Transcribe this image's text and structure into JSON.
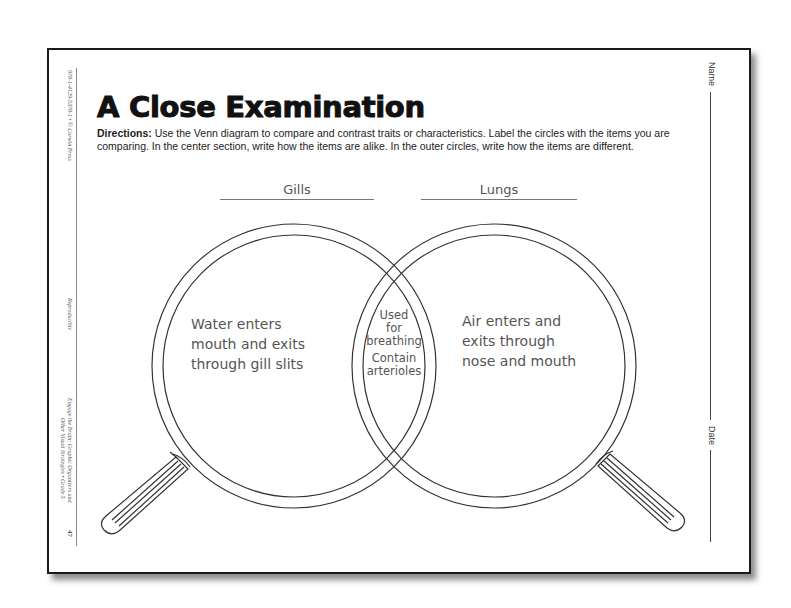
{
  "worksheet": {
    "title": "A Close Examination",
    "directions_label": "Directions:",
    "directions_text": " Use the Venn diagram to compare and contrast traits or characteristics. Label the circles with the items you are comparing. In the center section, write how the items are alike. In the outer circles, write how the items are different.",
    "left_margin": {
      "isbn": "978-1-4129-5378-1 • © Corwin Press",
      "reproducible": "Reproducible",
      "book_line1": "Engage the Brain: Graphic Organizers and",
      "book_line2": "Other Visual Strategies • Grade 5",
      "page_number": "47"
    },
    "right_margin": {
      "name_label": "Name",
      "date_label": "Date"
    }
  },
  "venn": {
    "left_label": "Gills",
    "right_label": "Lungs",
    "left_only": [
      "Water enters",
      "mouth and exits",
      "through gill slits"
    ],
    "overlap": [
      "Used",
      "for",
      "breathing",
      "Contain",
      "arterioles"
    ],
    "right_only": [
      "Air enters and",
      "exits through",
      "nose and mouth"
    ]
  },
  "colors": {
    "border": "#1a1a1a",
    "handwriting": "#555555",
    "line": "#444444"
  }
}
